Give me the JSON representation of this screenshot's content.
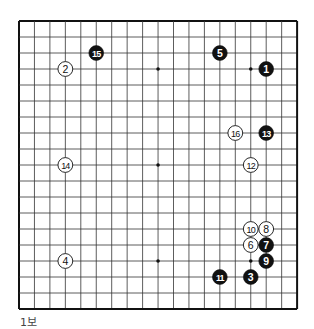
{
  "board": {
    "size": 19,
    "origin_x": 19,
    "origin_y": 21,
    "step_x": 15.45,
    "step_y": 16,
    "line_color": "#333333",
    "border_color": "#111111",
    "star_points": [
      [
        3,
        3
      ],
      [
        3,
        9
      ],
      [
        3,
        15
      ],
      [
        9,
        3
      ],
      [
        9,
        9
      ],
      [
        9,
        15
      ],
      [
        15,
        3
      ],
      [
        15,
        9
      ],
      [
        15,
        15
      ]
    ]
  },
  "stones": [
    {
      "move": "1",
      "color": "black",
      "col": 16,
      "row": 3
    },
    {
      "move": "2",
      "color": "white",
      "col": 3,
      "row": 3
    },
    {
      "move": "3",
      "color": "black",
      "col": 15,
      "row": 16
    },
    {
      "move": "4",
      "color": "white",
      "col": 3,
      "row": 15
    },
    {
      "move": "5",
      "color": "black",
      "col": 13,
      "row": 2
    },
    {
      "move": "6",
      "color": "white",
      "col": 15,
      "row": 14
    },
    {
      "move": "7",
      "color": "black",
      "col": 16,
      "row": 14
    },
    {
      "move": "8",
      "color": "white",
      "col": 16,
      "row": 13
    },
    {
      "move": "9",
      "color": "black",
      "col": 16,
      "row": 15
    },
    {
      "move": "10",
      "color": "white",
      "col": 15,
      "row": 13
    },
    {
      "move": "11",
      "color": "black",
      "col": 13,
      "row": 16
    },
    {
      "move": "12",
      "color": "white",
      "col": 15,
      "row": 9
    },
    {
      "move": "13",
      "color": "black",
      "col": 16,
      "row": 7
    },
    {
      "move": "14",
      "color": "white",
      "col": 3,
      "row": 9
    },
    {
      "move": "15",
      "color": "black",
      "col": 5,
      "row": 2
    },
    {
      "move": "16",
      "color": "white",
      "col": 14,
      "row": 7
    }
  ],
  "caption": "1보"
}
